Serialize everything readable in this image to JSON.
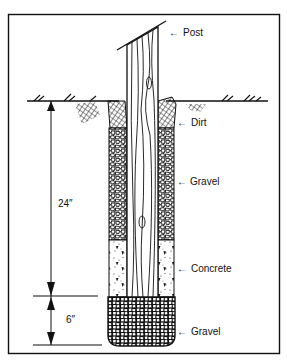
{
  "diagram": {
    "labels": {
      "post": "Post",
      "dirt": "Dirt",
      "gravel_upper": "Gravel",
      "concrete": "Concrete",
      "gravel_bottom": "Gravel"
    },
    "dimensions": {
      "upper": "24″",
      "lower": "6″"
    },
    "arrow_glyph": "←",
    "colors": {
      "ink": "#111111",
      "background": "#ffffff"
    }
  }
}
